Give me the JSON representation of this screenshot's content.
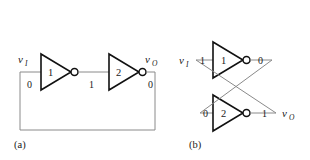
{
  "figure": {
    "colors": {
      "wire": "#8a8a8a",
      "outline": "#111111",
      "fill": "#ffffff",
      "text": "#1a1a1a"
    },
    "panels": [
      {
        "id": "a",
        "caption": "(a)",
        "description": "Two inverters in a ring: output fed back to input",
        "ports": [
          {
            "name": "input-port",
            "symbol": "v",
            "subscript": "I"
          },
          {
            "name": "output-port",
            "symbol": "v",
            "subscript": "O"
          }
        ],
        "inverters": [
          {
            "name": "inverter-1",
            "label": "1"
          },
          {
            "name": "inverter-2",
            "label": "2"
          }
        ],
        "logic_values": [
          {
            "name": "value-input",
            "value": "0"
          },
          {
            "name": "value-mid",
            "value": "1"
          },
          {
            "name": "value-output",
            "value": "0"
          }
        ]
      },
      {
        "id": "b",
        "caption": "(b)",
        "description": "Cross-coupled inverter pair (bistable latch)",
        "ports": [
          {
            "name": "input-port",
            "symbol": "v",
            "subscript": "I"
          },
          {
            "name": "output-port",
            "symbol": "v",
            "subscript": "O"
          }
        ],
        "inverters": [
          {
            "name": "inverter-1",
            "label": "1"
          },
          {
            "name": "inverter-2",
            "label": "2"
          }
        ],
        "logic_values": [
          {
            "name": "value-top-input",
            "value": "1"
          },
          {
            "name": "value-top-output",
            "value": "0"
          },
          {
            "name": "value-bottom-input",
            "value": "0"
          },
          {
            "name": "value-bottom-output",
            "value": "1"
          }
        ]
      }
    ]
  }
}
